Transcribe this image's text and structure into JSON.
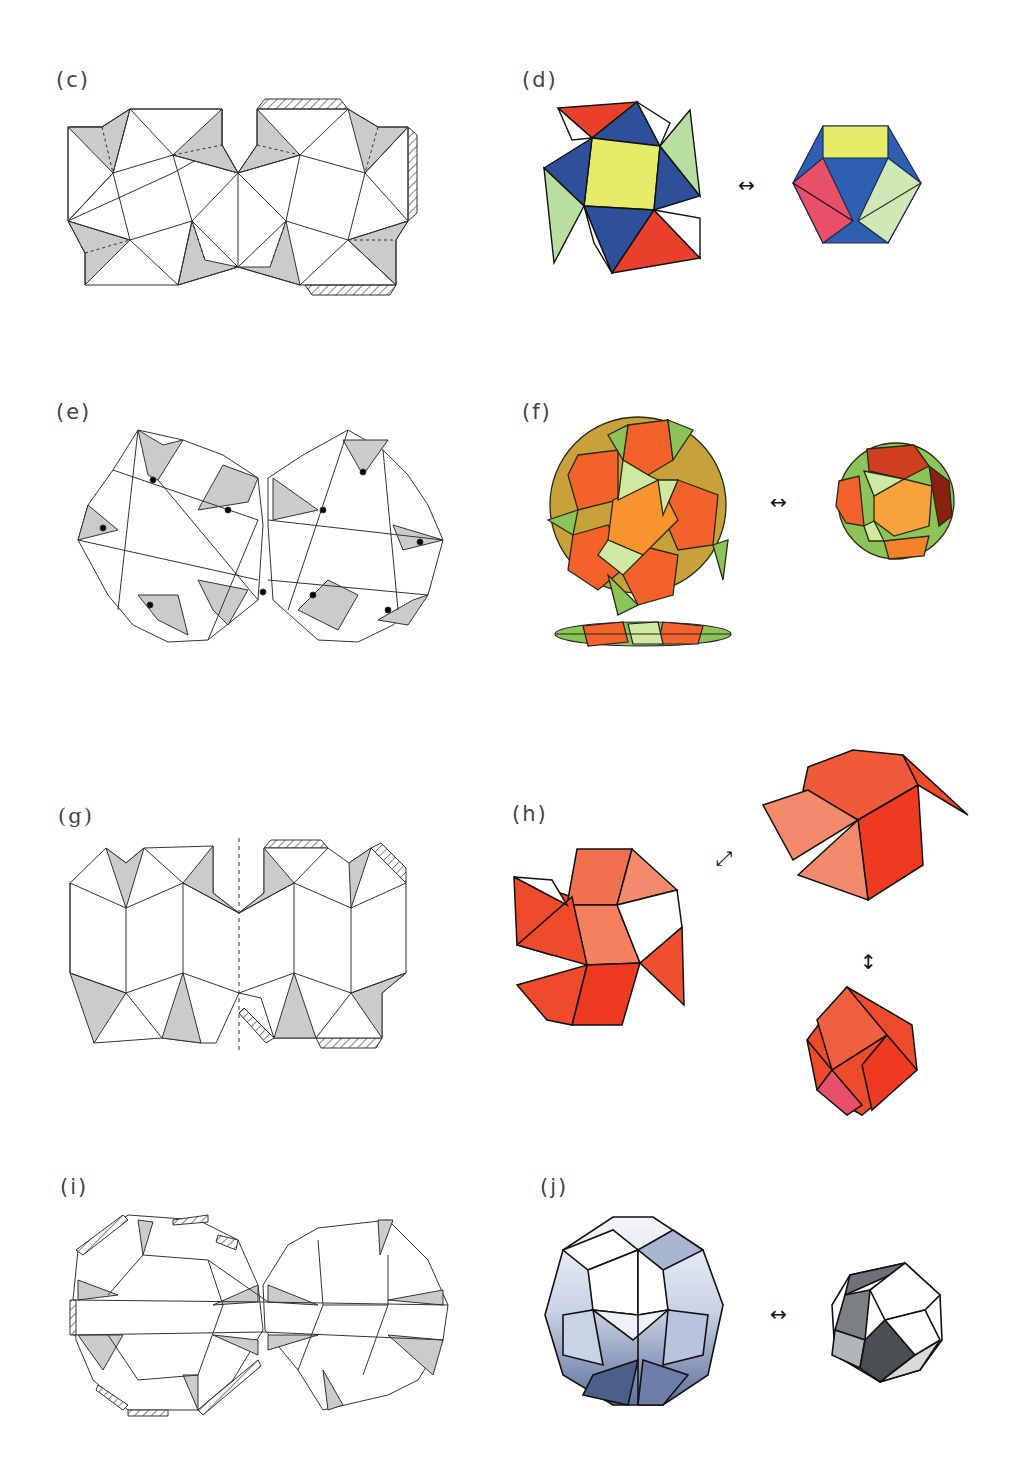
{
  "figure": {
    "panels": [
      {
        "id": "c",
        "label": "(c)",
        "kind": "flat-net",
        "description": "net of cuboctahedron-like folding with shaded triangular flaps and hatched glue tabs"
      },
      {
        "id": "d",
        "label": "(d)",
        "kind": "folded-model",
        "description": "flat folded state and cuboctahedron state",
        "colors": [
          "#e8402a",
          "#2e4f99",
          "#e6ec6a",
          "#b9dfa0"
        ]
      },
      {
        "id": "e",
        "label": "(e)",
        "kind": "flat-net",
        "description": "net with rounded outline, shaded flaps with black vertices and hatched tabs"
      },
      {
        "id": "f",
        "label": "(f)",
        "kind": "folded-model",
        "description": "expanded state, flattened side view and rhombicosidodecahedron-like state",
        "colors": [
          "#f2622a",
          "#f7942e",
          "#8cc45a",
          "#cfe8a4"
        ]
      },
      {
        "id": "g",
        "label": "(g)",
        "kind": "flat-net",
        "description": "net with dashed center axis, shaded flaps and hatched tabs"
      },
      {
        "id": "h",
        "label": "(h)",
        "kind": "folded-model",
        "description": "three states of red folding model",
        "colors": [
          "#ee4a2c",
          "#f48a6c",
          "#e8506a"
        ]
      },
      {
        "id": "i",
        "label": "(i)",
        "kind": "flat-net",
        "description": "net of rhombic faces with shaded slivers and hatched tabs"
      },
      {
        "id": "j",
        "label": "(j)",
        "kind": "folded-model",
        "description": "expanded blue-gray rhombic model and rhombic triacontahedron-like state",
        "colors": [
          "#6d7fa8",
          "#c9d3e6",
          "#4c4f52"
        ]
      }
    ],
    "arrows": {
      "d": "↔",
      "f": "↔",
      "h_diag": "⤢",
      "h_vert": "↕",
      "j": "↔"
    },
    "style": {
      "line_color": "#333333",
      "flap_fill": "#cbcbcb",
      "background": "#ffffff"
    }
  }
}
